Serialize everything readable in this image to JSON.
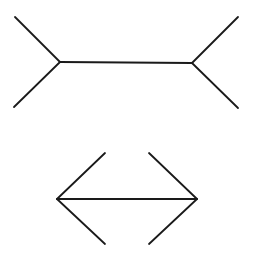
{
  "diagram": {
    "type": "muller-lyer-illusion",
    "background": "#ffffff",
    "stroke_color": "#1a1a1a",
    "figures": [
      {
        "name": "fins-out",
        "shaft": {
          "x1": 60,
          "y1": 62,
          "x2": 192,
          "y2": 63
        },
        "fins": [
          {
            "x1": 60,
            "y1": 62,
            "x2": 15,
            "y2": 17
          },
          {
            "x1": 60,
            "y1": 62,
            "x2": 14,
            "y2": 107
          },
          {
            "x1": 192,
            "y1": 63,
            "x2": 238,
            "y2": 17
          },
          {
            "x1": 192,
            "y1": 63,
            "x2": 238,
            "y2": 108
          }
        ]
      },
      {
        "name": "fins-in",
        "shaft": {
          "x1": 57,
          "y1": 199,
          "x2": 197,
          "y2": 199
        },
        "fins": [
          {
            "x1": 57,
            "y1": 199,
            "x2": 105,
            "y2": 153
          },
          {
            "x1": 57,
            "y1": 199,
            "x2": 105,
            "y2": 244
          },
          {
            "x1": 197,
            "y1": 199,
            "x2": 149,
            "y2": 153
          },
          {
            "x1": 197,
            "y1": 199,
            "x2": 149,
            "y2": 244
          }
        ]
      }
    ]
  }
}
